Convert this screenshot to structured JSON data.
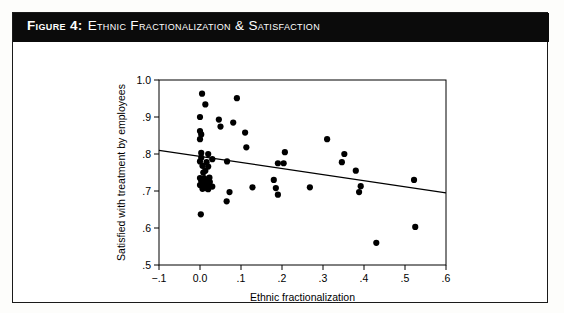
{
  "figure": {
    "caption_number": "Figure 4:",
    "caption_text": "Ethnic Fractionalization & Satisfaction",
    "title_bar_color": "#0b0b0b",
    "title_text_color": "#ffffff",
    "border_color": "#1a1a1a",
    "background_color": "#ffffff"
  },
  "chart_data": {
    "type": "scatter",
    "title": "",
    "xlabel": "Ethnic fractionalization",
    "ylabel": "Satisfied with treatment by employees",
    "xlim": [
      -0.1,
      0.6
    ],
    "ylim": [
      0.5,
      1.0
    ],
    "xticks": [
      -0.1,
      0.0,
      0.1,
      0.2,
      0.3,
      0.4,
      0.5,
      0.6
    ],
    "xticklabels": [
      "−.1",
      "0.0",
      ".1",
      ".2",
      ".3",
      ".4",
      ".5",
      ".6"
    ],
    "yticks": [
      0.5,
      0.6,
      0.7,
      0.8,
      0.9,
      1.0
    ],
    "yticklabels": [
      ".5",
      ".6",
      ".7",
      ".8",
      ".9",
      "1.0"
    ],
    "grid": false,
    "legend": false,
    "marker_color": "#000000",
    "marker_size": 5,
    "points": [
      [
        0.005,
        0.963
      ],
      [
        0.013,
        0.934
      ],
      [
        0.09,
        0.951
      ],
      [
        0.0,
        0.9
      ],
      [
        0.046,
        0.893
      ],
      [
        0.081,
        0.885
      ],
      [
        0.05,
        0.874
      ],
      [
        0.0,
        0.862
      ],
      [
        0.003,
        0.853
      ],
      [
        0.11,
        0.858
      ],
      [
        0.0,
        0.84
      ],
      [
        0.113,
        0.818
      ],
      [
        0.31,
        0.84
      ],
      [
        0.003,
        0.803
      ],
      [
        0.02,
        0.8
      ],
      [
        0.207,
        0.805
      ],
      [
        0.352,
        0.8
      ],
      [
        0.003,
        0.79
      ],
      [
        0.03,
        0.786
      ],
      [
        0.0,
        0.78
      ],
      [
        0.016,
        0.778
      ],
      [
        0.066,
        0.78
      ],
      [
        0.19,
        0.775
      ],
      [
        0.204,
        0.775
      ],
      [
        0.346,
        0.778
      ],
      [
        0.006,
        0.768
      ],
      [
        0.02,
        0.766
      ],
      [
        0.013,
        0.755
      ],
      [
        0.008,
        0.75
      ],
      [
        0.38,
        0.755
      ],
      [
        0.0,
        0.735
      ],
      [
        0.01,
        0.735
      ],
      [
        0.023,
        0.736
      ],
      [
        0.003,
        0.727
      ],
      [
        0.013,
        0.725
      ],
      [
        0.024,
        0.724
      ],
      [
        0.18,
        0.73
      ],
      [
        0.522,
        0.73
      ],
      [
        0.0,
        0.716
      ],
      [
        0.008,
        0.714
      ],
      [
        0.016,
        0.713
      ],
      [
        0.022,
        0.712
      ],
      [
        0.013,
        0.708
      ],
      [
        0.006,
        0.706
      ],
      [
        0.02,
        0.705
      ],
      [
        0.03,
        0.712
      ],
      [
        0.128,
        0.71
      ],
      [
        0.185,
        0.708
      ],
      [
        0.268,
        0.71
      ],
      [
        0.392,
        0.713
      ],
      [
        0.072,
        0.697
      ],
      [
        0.19,
        0.69
      ],
      [
        0.388,
        0.697
      ],
      [
        0.065,
        0.672
      ],
      [
        0.002,
        0.637
      ],
      [
        0.525,
        0.603
      ],
      [
        0.43,
        0.56
      ]
    ],
    "trend_line": {
      "x_start": -0.1,
      "y_start": 0.81,
      "x_end": 0.6,
      "y_end": 0.695,
      "color": "#000000"
    }
  }
}
